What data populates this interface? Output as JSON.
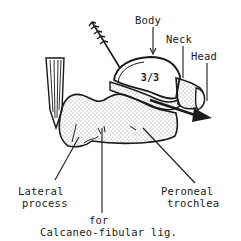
{
  "diagram": {
    "fraction_mark": "3/3",
    "labels": {
      "body": "Body",
      "neck": "Neck",
      "head": "Head",
      "lateral_process_line1": "Lateral",
      "lateral_process_line2": "process",
      "peroneal_line1": "Peroneal",
      "peroneal_line2": "trochlea",
      "for_line1": "for",
      "for_line2": "Calcaneo-fibular lig."
    },
    "colors": {
      "ink": "#1a1a1a",
      "paper": "#ffffff"
    }
  }
}
